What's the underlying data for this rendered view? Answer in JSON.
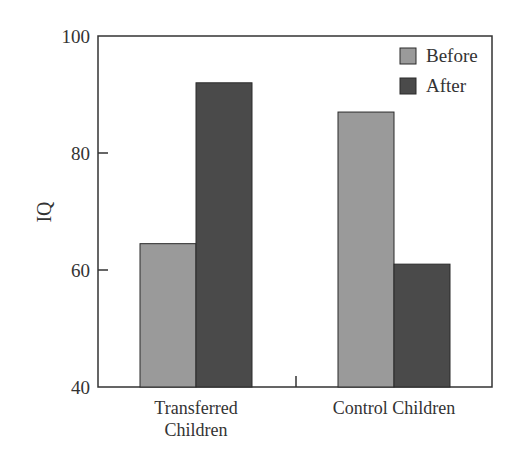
{
  "chart_data": {
    "type": "bar",
    "title": "",
    "xlabel": "",
    "ylabel": "IQ",
    "ylim": [
      40,
      100
    ],
    "yticks": [
      40,
      60,
      80,
      100
    ],
    "categories": [
      "Transferred Children",
      "Control Children"
    ],
    "category_label_lines": [
      [
        "Transferred",
        "Children"
      ],
      [
        "Control Children"
      ]
    ],
    "series": [
      {
        "name": "Before",
        "color": "#9a9a9a",
        "values": [
          64.5,
          87
        ]
      },
      {
        "name": "After",
        "color": "#4a4a4a",
        "values": [
          92,
          61
        ]
      }
    ],
    "grid": false,
    "legend_position": "top-right"
  }
}
